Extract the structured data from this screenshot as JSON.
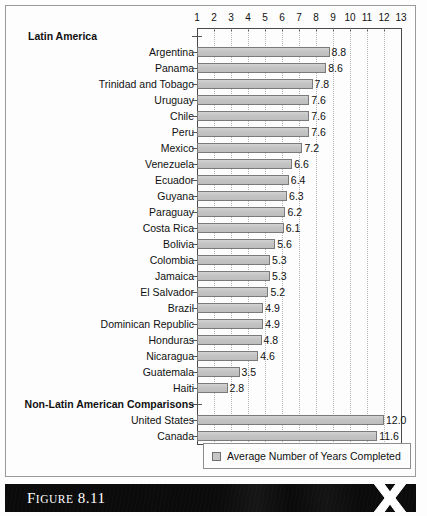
{
  "figure": {
    "caption_prefix": "F",
    "caption_small": "IGURE",
    "caption_number": " 8.11",
    "caption_full": "FIGURE 8.11",
    "logo_icon": "x-logo-icon"
  },
  "legend": {
    "swatch_icon": "legend-swatch-icon",
    "label": "Average Number of Years Completed"
  },
  "sections": {
    "latin_america": "Latin America",
    "non_latin": "Non-Latin American Comparisons"
  },
  "colors": {
    "bar_fill": "#c6c6c6",
    "bar_border": "#7a7a7a",
    "axis": "#4a4a4a",
    "gridline": "#b4b4b4",
    "caption_bar": "#0b0b0b",
    "caption_text": "#ffffff"
  },
  "chart_data": {
    "type": "bar",
    "orientation": "horizontal",
    "title": "FIGURE 8.11",
    "xlabel": "",
    "ylabel": "",
    "xlim": [
      1,
      13
    ],
    "baseline": 1,
    "grid": true,
    "legend_position": "bottom",
    "xticks": [
      1,
      2,
      3,
      4,
      5,
      6,
      7,
      8,
      9,
      10,
      11,
      12,
      13
    ],
    "xticklabels": [
      "1",
      "2",
      "3",
      "4",
      "5",
      "6",
      "7",
      "8",
      "9",
      "10",
      "11",
      "12",
      "13"
    ],
    "series": [
      {
        "name": "Average Number of Years Completed",
        "categories": [
          "Argentina",
          "Panama",
          "Trinidad and Tobago",
          "Uruguay",
          "Chile",
          "Peru",
          "Mexico",
          "Venezuela",
          "Ecuador",
          "Guyana",
          "Paraguay",
          "Costa Rica",
          "Bolivia",
          "Colombia",
          "Jamaica",
          "El Salvador",
          "Brazil",
          "Dominican Republic",
          "Honduras",
          "Nicaragua",
          "Guatemala",
          "Haiti",
          "United States",
          "Canada"
        ],
        "values": [
          8.8,
          8.6,
          7.8,
          7.6,
          7.6,
          7.6,
          7.2,
          6.6,
          6.4,
          6.3,
          6.2,
          6.1,
          5.6,
          5.3,
          5.3,
          5.2,
          4.9,
          4.9,
          4.8,
          4.6,
          3.5,
          2.8,
          12.0,
          11.6
        ]
      }
    ],
    "groups": [
      {
        "header": "Latin America",
        "header_align": "left",
        "rows": [
          {
            "label": "Argentina",
            "value": 8.8,
            "value_text": "8.8"
          },
          {
            "label": "Panama",
            "value": 8.6,
            "value_text": "8.6"
          },
          {
            "label": "Trinidad and Tobago",
            "value": 7.8,
            "value_text": "7.8"
          },
          {
            "label": "Uruguay",
            "value": 7.6,
            "value_text": "7.6"
          },
          {
            "label": "Chile",
            "value": 7.6,
            "value_text": "7.6"
          },
          {
            "label": "Peru",
            "value": 7.6,
            "value_text": "7.6"
          },
          {
            "label": "Mexico",
            "value": 7.2,
            "value_text": "7.2"
          },
          {
            "label": "Venezuela",
            "value": 6.6,
            "value_text": "6.6"
          },
          {
            "label": "Ecuador",
            "value": 6.4,
            "value_text": "6.4"
          },
          {
            "label": "Guyana",
            "value": 6.3,
            "value_text": "6.3"
          },
          {
            "label": "Paraguay",
            "value": 6.2,
            "value_text": "6.2"
          },
          {
            "label": "Costa Rica",
            "value": 6.1,
            "value_text": "6.1"
          },
          {
            "label": "Bolivia",
            "value": 5.6,
            "value_text": "5.6"
          },
          {
            "label": "Colombia",
            "value": 5.3,
            "value_text": "5.3"
          },
          {
            "label": "Jamaica",
            "value": 5.3,
            "value_text": "5.3"
          },
          {
            "label": "El Salvador",
            "value": 5.2,
            "value_text": "5.2"
          },
          {
            "label": "Brazil",
            "value": 4.9,
            "value_text": "4.9"
          },
          {
            "label": "Dominican Republic",
            "value": 4.9,
            "value_text": "4.9"
          },
          {
            "label": "Honduras",
            "value": 4.8,
            "value_text": "4.8"
          },
          {
            "label": "Nicaragua",
            "value": 4.6,
            "value_text": "4.6"
          },
          {
            "label": "Guatemala",
            "value": 3.5,
            "value_text": "3.5"
          },
          {
            "label": "Haiti",
            "value": 2.8,
            "value_text": "2.8"
          }
        ]
      },
      {
        "header": "Non-Latin American Comparisons",
        "header_align": "right",
        "rows": [
          {
            "label": "United States",
            "value": 12.0,
            "value_text": "12.0"
          },
          {
            "label": "Canada",
            "value": 11.6,
            "value_text": "11.6"
          }
        ]
      }
    ]
  }
}
